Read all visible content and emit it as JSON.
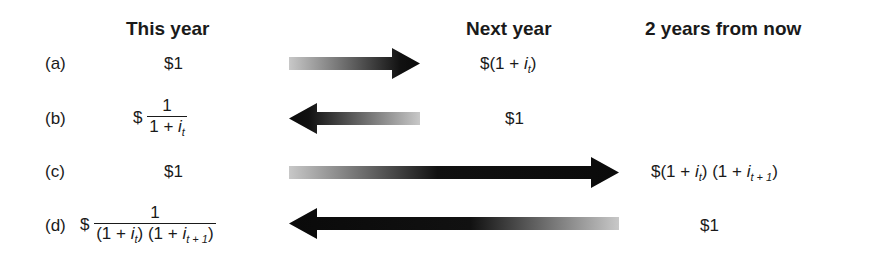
{
  "headers": {
    "this_year": "This year",
    "next_year": "Next year",
    "two_years": "2 years from now"
  },
  "rows": [
    {
      "label": "(a)",
      "this_year": "$1",
      "next_year": {
        "prefix": "$(1 + ",
        "var": "i",
        "sub": "t",
        "suffix": ")"
      },
      "arrow": "right"
    },
    {
      "label": "(b)",
      "this_year": {
        "prefix": "$",
        "numerator": "1",
        "denominator_prefix": "1 + ",
        "var": "i",
        "sub": "t"
      },
      "next_year": "$1",
      "arrow": "left"
    },
    {
      "label": "(c)",
      "this_year": "$1",
      "two_years": {
        "prefix": "$(1 + ",
        "var1": "i",
        "sub1": "t",
        "mid": ") (1 + ",
        "var2": "i",
        "sub2": "t + 1",
        "suffix": ")"
      },
      "arrow": "right"
    },
    {
      "label": "(d)",
      "this_year": {
        "prefix": "$",
        "numerator": "1",
        "den_a": "(1 + ",
        "var1": "i",
        "sub1": "t",
        "den_b": ") (1 + ",
        "var2": "i",
        "sub2": "t + 1",
        "den_c": ")"
      },
      "two_years": "$1",
      "arrow": "left"
    }
  ],
  "colors": {
    "arrow_dark": "#0a0a0a",
    "arrow_light": "#c8c8c8",
    "text": "#1a1a1a"
  }
}
